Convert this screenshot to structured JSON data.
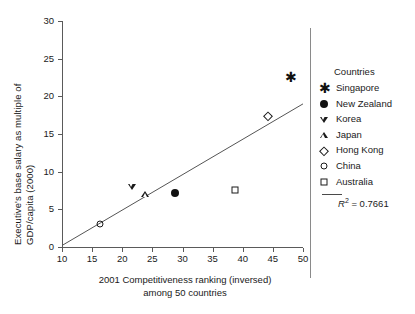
{
  "chart_data": {
    "type": "scatter",
    "title": "",
    "xlabel": "2001 Competitiveness ranking (inversed) among 50 countries",
    "xlabel_line1": "2001 Competitiveness ranking (inversed)",
    "xlabel_line2": "among 50 countries",
    "ylabel": "Executive's base salary as multiple of GDP/capita (2000)",
    "ylabel_line1": "Executive's base salary as multiple of",
    "ylabel_line2": "GDP/capita (2000)",
    "xlim": [
      10,
      50
    ],
    "ylim": [
      0,
      30
    ],
    "xticks": [
      10,
      15,
      20,
      25,
      30,
      35,
      40,
      45,
      50
    ],
    "yticks": [
      0,
      5,
      10,
      15,
      20,
      25,
      30
    ],
    "grid": false,
    "legend_position": "right",
    "legend_title": "Countries",
    "points": [
      {
        "label": "China",
        "marker": "circle-open",
        "x": 16.3,
        "y": 3.0
      },
      {
        "label": "Korea",
        "marker": "triangle-down",
        "x": 21.6,
        "y": 8.0
      },
      {
        "label": "Japan",
        "marker": "triangle-up",
        "x": 23.8,
        "y": 7.0
      },
      {
        "label": "New Zealand",
        "marker": "circle-filled",
        "x": 28.8,
        "y": 7.2
      },
      {
        "label": "Australia",
        "marker": "square-open",
        "x": 38.7,
        "y": 7.6
      },
      {
        "label": "Hong Kong",
        "marker": "diamond-open",
        "x": 44.2,
        "y": 17.4
      },
      {
        "label": "Singapore",
        "marker": "asterisk",
        "x": 47.9,
        "y": 22.5
      }
    ],
    "trendline": {
      "x0": 10,
      "y0": 0.2,
      "x1": 50,
      "y1": 19.0,
      "r_squared": 0.7661
    },
    "annotations": [
      {
        "text": "R2 = 0.7661",
        "value": 0.7661
      }
    ]
  },
  "legend": {
    "title": "Countries",
    "items": [
      {
        "label": "Singapore",
        "marker": "asterisk"
      },
      {
        "label": "New Zealand",
        "marker": "circle-filled"
      },
      {
        "label": "Korea",
        "marker": "triangle-down"
      },
      {
        "label": "Japan",
        "marker": "triangle-up"
      },
      {
        "label": "Hong Kong",
        "marker": "diamond-open"
      },
      {
        "label": "China",
        "marker": "circle-open"
      },
      {
        "label": "Australia",
        "marker": "square-open"
      }
    ],
    "r2_symbol": "R",
    "r2_exponent": "2",
    "r2_equals": "= 0.7661"
  },
  "axes": {
    "y_title_line1": "Executive's base salary as multiple of",
    "y_title_line2": "GDP/capita (2000)",
    "x_title_line1": "2001 Competitiveness ranking (inversed)",
    "x_title_line2": "among 50 countries",
    "x_tick_labels": [
      "10",
      "15",
      "20",
      "25",
      "30",
      "35",
      "40",
      "45",
      "50"
    ],
    "y_tick_labels": [
      "0",
      "5",
      "10",
      "15",
      "20",
      "25",
      "30"
    ]
  },
  "colors": {
    "marker": "#111111",
    "axis": "#5a5a5a",
    "trendline": "#555555",
    "text": "#1a1a1a",
    "background": "#ffffff"
  }
}
